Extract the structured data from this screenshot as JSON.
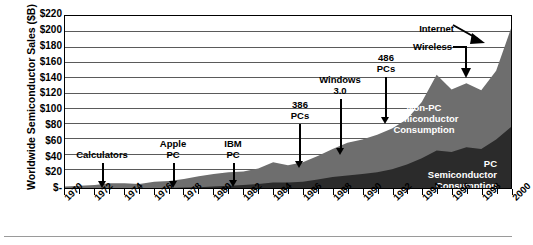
{
  "chart_data": {
    "type": "area",
    "title": "",
    "xlabel": "",
    "ylabel": "Worldwide Semiconductor Sales ($B)",
    "stacked": true,
    "grid": true,
    "legend_position": "inside-plot",
    "xlim": [
      1970,
      2000
    ],
    "ylim": [
      0,
      220
    ],
    "ytick_labels": [
      "$220",
      "$200",
      "$180",
      "$160",
      "$140",
      "$120",
      "$100",
      "$80",
      "$60",
      "$40",
      "$20",
      "$-"
    ],
    "ytick_values": [
      220,
      200,
      180,
      160,
      140,
      120,
      100,
      80,
      60,
      40,
      20,
      0
    ],
    "xtick_labels": [
      "1970",
      "1972",
      "1974",
      "1976",
      "1978",
      "1980",
      "1982",
      "1984",
      "1986",
      "1988",
      "1990",
      "1992",
      "1994",
      "1996",
      "1998",
      "2000"
    ],
    "xtick_values": [
      1970,
      1972,
      1974,
      1976,
      1978,
      1980,
      1982,
      1984,
      1986,
      1988,
      1990,
      1992,
      1994,
      1996,
      1998,
      2000
    ],
    "x": [
      1970,
      1971,
      1972,
      1973,
      1974,
      1975,
      1976,
      1977,
      1978,
      1979,
      1980,
      1981,
      1982,
      1983,
      1984,
      1985,
      1986,
      1987,
      1988,
      1989,
      1990,
      1991,
      1992,
      1993,
      1994,
      1995,
      1996,
      1997,
      1998,
      1999,
      2000
    ],
    "series": [
      {
        "name": "PC Semiconductor Consumption",
        "color": "#2b2b2b",
        "values": [
          0,
          0,
          0,
          0,
          0,
          0,
          0,
          0,
          0.5,
          1,
          2,
          3,
          4,
          5,
          7,
          7,
          8,
          11,
          14,
          16,
          18,
          20,
          24,
          30,
          38,
          48,
          46,
          52,
          50,
          62,
          78
        ]
      },
      {
        "name": "Non-PC Semiconductor Consumption",
        "color": "#6e6e6e",
        "values": [
          2,
          3,
          4,
          6,
          6,
          5,
          8,
          9,
          11,
          14,
          16,
          17,
          17,
          20,
          26,
          22,
          25,
          30,
          36,
          42,
          44,
          48,
          52,
          58,
          72,
          97,
          80,
          82,
          75,
          88,
          126
        ]
      }
    ],
    "total_values": [
      2,
      3,
      4,
      6,
      6,
      5,
      8,
      9,
      11.5,
      15,
      18,
      20,
      21,
      25,
      33,
      29,
      33,
      41,
      50,
      58,
      62,
      68,
      76,
      88,
      110,
      145,
      126,
      134,
      125,
      150,
      204
    ],
    "annotations": [
      {
        "label": "Calculators",
        "x_year": 1973,
        "arrow": "down"
      },
      {
        "label": "Apple\nPC",
        "x_year": 1978,
        "arrow": "down"
      },
      {
        "label": "IBM\nPC",
        "x_year": 1982,
        "arrow": "down"
      },
      {
        "label": "386\nPCs",
        "x_year": 1986,
        "arrow": "down"
      },
      {
        "label": "Windows\n3.0",
        "x_year": 1988,
        "arrow": "down"
      },
      {
        "label": "486\nPCs",
        "x_year": 1991,
        "arrow": "down"
      },
      {
        "label": "Wireless",
        "x_year": 1998,
        "arrow": "elbow-down"
      },
      {
        "label": "Internet",
        "x_year": 2000,
        "arrow": "diagonal"
      }
    ]
  },
  "axis": {
    "y_title": "Worldwide Semiconductor Sales ($B)",
    "y_ticks": [
      "$220",
      "$200",
      "$180",
      "$160",
      "$140",
      "$120",
      "$100",
      "$80",
      "$60",
      "$40",
      "$20",
      "$-"
    ],
    "x_ticks": [
      "1970",
      "1972",
      "1974",
      "1976",
      "1978",
      "1980",
      "1982",
      "1984",
      "1986",
      "1988",
      "1990",
      "1992",
      "1994",
      "1996",
      "1998",
      "2000"
    ]
  },
  "annotations": {
    "calculators": "Calculators",
    "apple_pc": "Apple\nPC",
    "ibm_pc": "IBM\nPC",
    "p386_pcs": "386\nPCs",
    "windows_30": "Windows\n3.0",
    "p486_pcs": "486\nPCs",
    "wireless": "Wireless",
    "internet": "Internet"
  },
  "regions": {
    "non_pc": "Non-PC\nSemiconductor\nConsumption",
    "pc": "PC\nSemiconductor\nConsumption"
  },
  "colors": {
    "non_pc_area": "#6e6e6e",
    "pc_area": "#2b2b2b",
    "gridline": "#5a5a5a",
    "axis": "#000000",
    "background": "#ffffff",
    "region_label_text": "#ffffff"
  }
}
